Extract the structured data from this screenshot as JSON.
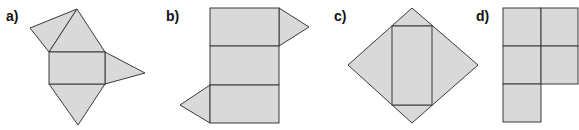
{
  "figures": [
    {
      "label": "a)",
      "description": "net: rectangle with four triangles"
    },
    {
      "label": "b)",
      "description": "net: three stacked rectangles with two triangles"
    },
    {
      "label": "c)",
      "description": "net: rectangle inside rhombus-like arrangement of four triangles"
    },
    {
      "label": "d)",
      "description": "net: five squares in a 2-2-1 arrangement"
    }
  ],
  "colors": {
    "fill": "#d9d9d9",
    "stroke": "#3a3a3a"
  }
}
